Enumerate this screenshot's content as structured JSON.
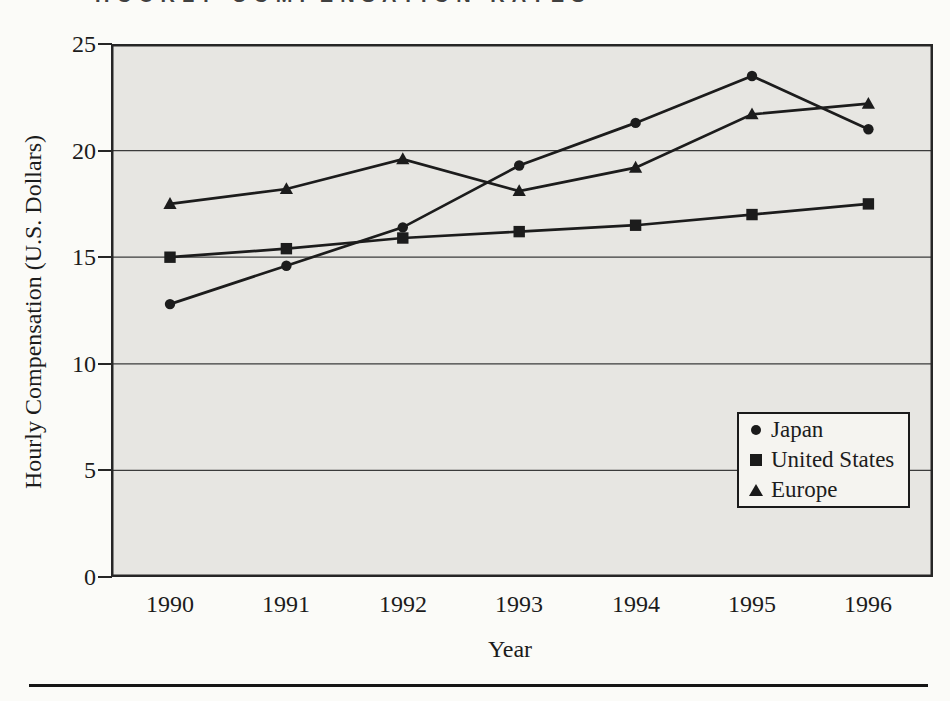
{
  "page": {
    "top_heading_partial": "HOURLY COMPENSATION RATES"
  },
  "chart_data": {
    "type": "line",
    "x": [
      1990,
      1991,
      1992,
      1993,
      1994,
      1995,
      1996
    ],
    "series": [
      {
        "name": "Japan",
        "marker": "circle",
        "values": [
          12.8,
          14.6,
          16.4,
          19.3,
          21.3,
          23.5,
          21.0
        ]
      },
      {
        "name": "United States",
        "marker": "square",
        "values": [
          15.0,
          15.4,
          15.9,
          16.2,
          16.5,
          17.0,
          17.5
        ]
      },
      {
        "name": "Europe",
        "marker": "triangle",
        "values": [
          17.5,
          18.2,
          19.6,
          18.1,
          19.2,
          21.7,
          22.2
        ]
      }
    ],
    "xlabel": "Year",
    "ylabel": "Hourly Compensation (U.S. Dollars)",
    "ylim": [
      0,
      25
    ],
    "yticks": [
      0,
      5,
      10,
      15,
      20,
      25
    ],
    "grid": "horizontal",
    "legend_position": "inside-lower-right",
    "colors": {
      "line": "#1c1c1c",
      "plot_background": "#e7e6e2",
      "gridline": "#3b3b3b",
      "frame": "#262626",
      "page_background": "#fbfbf8"
    }
  }
}
